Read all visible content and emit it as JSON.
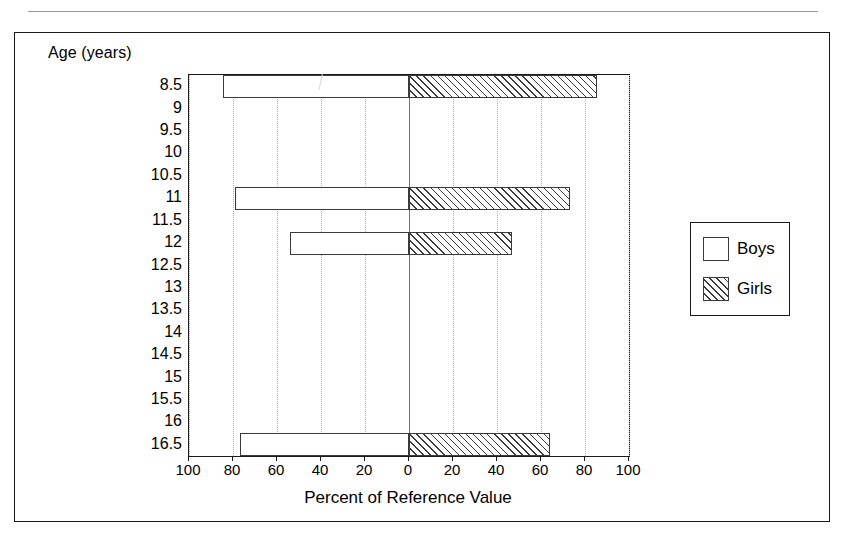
{
  "caption": {
    "top_text_partial": ""
  },
  "figure": {
    "y_axis_title": "Age (years)",
    "x_axis_title": "Percent of Reference Value"
  },
  "legend": {
    "items": [
      {
        "label": "Boys",
        "swatch": "empty-box"
      },
      {
        "label": "Girls",
        "swatch": "hatched-box"
      }
    ]
  },
  "chart_data": {
    "type": "bar",
    "orientation": "horizontal-diverging",
    "title": "",
    "xlabel": "Percent of Reference Value",
    "ylabel": "Age (years)",
    "categories": [
      "8.5",
      "9",
      "9.5",
      "10",
      "10.5",
      "11",
      "11.5",
      "12",
      "12.5",
      "13",
      "13.5",
      "14",
      "14.5",
      "15",
      "15.5",
      "16",
      "16.5"
    ],
    "x_tick_labels": [
      "100",
      "80",
      "60",
      "40",
      "20",
      "0",
      "20",
      "40",
      "60",
      "80",
      "100"
    ],
    "x_tick_values": [
      -100,
      -80,
      -60,
      -40,
      -20,
      0,
      20,
      40,
      60,
      80,
      100
    ],
    "xlim": [
      -100,
      100
    ],
    "grid": "vertical-dotted",
    "legend_position": "right-outside",
    "series": [
      {
        "name": "Boys",
        "direction": "left",
        "fill": "white",
        "values": [
          84.5,
          0,
          0,
          0,
          0,
          79,
          0,
          54,
          0,
          0,
          0,
          0,
          0,
          0,
          0,
          0,
          77
        ]
      },
      {
        "name": "Girls",
        "direction": "right",
        "fill": "diagonal-hatch",
        "values": [
          85.5,
          0,
          0,
          0,
          0,
          73,
          0,
          47,
          0,
          0,
          0,
          0,
          0,
          0,
          0,
          0,
          64
        ]
      }
    ]
  }
}
